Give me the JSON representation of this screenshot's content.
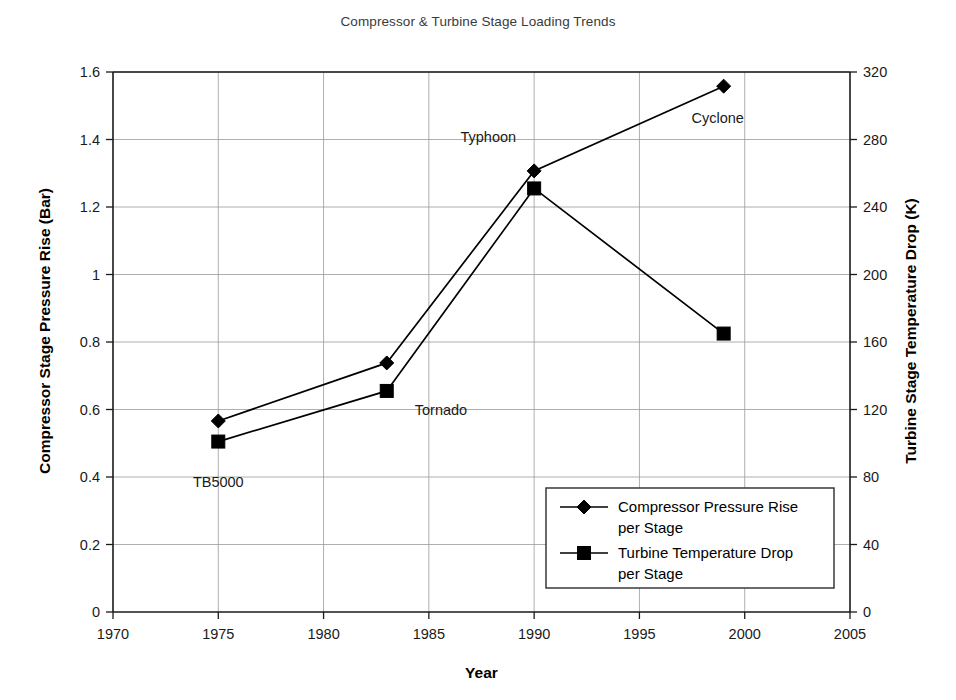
{
  "chart_data": {
    "type": "line",
    "title": "Compressor & Turbine Stage Loading Trends",
    "xlabel": "Year",
    "ylabel": "Compressor Stage Pressure Rise (Bar)",
    "ylabel_right": "Turbine Stage Temperature Drop (K)",
    "x": [
      1975,
      1983,
      1990,
      1999
    ],
    "xlim": [
      1970,
      2005
    ],
    "ylim": [
      0,
      1.6
    ],
    "ylim_right": [
      0,
      320
    ],
    "xticks": [
      "1970",
      "1975",
      "1980",
      "1985",
      "1990",
      "1995",
      "2000",
      "2005"
    ],
    "xtick_values": [
      1970,
      1975,
      1980,
      1985,
      1990,
      1995,
      2000,
      2005
    ],
    "yticks": [
      "0",
      "0.2",
      "0.4",
      "0.6",
      "0.8",
      "1",
      "1.2",
      "1.4",
      "1.6"
    ],
    "ytick_values": [
      0,
      0.2,
      0.4,
      0.6,
      0.8,
      1.0,
      1.2,
      1.4,
      1.6
    ],
    "yticks_right": [
      "0",
      "40",
      "80",
      "120",
      "160",
      "200",
      "240",
      "280",
      "320"
    ],
    "ytick_right_values": [
      0,
      40,
      80,
      120,
      160,
      200,
      240,
      280,
      320
    ],
    "grid": true,
    "legend_position": "lower-right",
    "series": [
      {
        "name": "Compressor Pressure Rise per Stage",
        "axis": "left",
        "marker": "diamond",
        "color": "#000000",
        "values": [
          0.566,
          0.738,
          1.307,
          1.558
        ]
      },
      {
        "name": "Turbine Temperature Drop per Stage",
        "axis": "right",
        "marker": "square",
        "color": "#000000",
        "values": [
          101,
          131,
          251,
          165
        ]
      }
    ],
    "annotations": [
      {
        "label": "TB5000",
        "x": 1975,
        "anchor_value": 0.566,
        "axis": "left"
      },
      {
        "label": "Tornado",
        "x": 1983,
        "anchor_value": 0.738,
        "axis": "left"
      },
      {
        "label": "Typhoon",
        "x": 1990,
        "anchor_value": 1.307,
        "axis": "left"
      },
      {
        "label": "Cyclone",
        "x": 1999,
        "anchor_value": 1.558,
        "axis": "left"
      }
    ]
  },
  "legend": {
    "entries": [
      {
        "line1": "Compressor Pressure Rise",
        "line2": "per Stage",
        "marker": "diamond"
      },
      {
        "line2b": "Turbine Temperature Drop",
        "line2c": "per Stage",
        "marker": "square"
      }
    ],
    "item0_line1": "Compressor Pressure Rise",
    "item0_line2": "per Stage",
    "item1_line1": "Turbine Temperature Drop",
    "item1_line2": "per Stage"
  },
  "colors": {
    "series": "#000000",
    "grid": "#9a9a9a",
    "axis": "#1a1a1a",
    "background": "#ffffff",
    "title": "#3a3a3a"
  }
}
